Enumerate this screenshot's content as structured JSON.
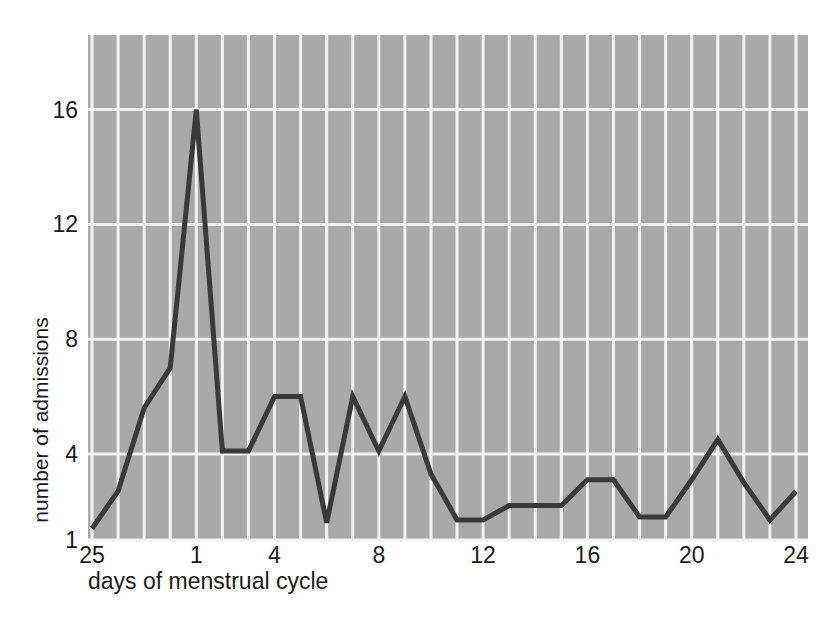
{
  "chart_data": {
    "type": "line",
    "title": "",
    "xlabel": "days of menstrual cycle",
    "ylabel": "number of admissions",
    "x": [
      25,
      26,
      27,
      28,
      1,
      2,
      3,
      4,
      5,
      6,
      7,
      8,
      9,
      10,
      11,
      12,
      13,
      14,
      15,
      16,
      17,
      18,
      19,
      20,
      21,
      22,
      23,
      24
    ],
    "values": [
      1.4,
      2.7,
      5.6,
      7.0,
      16.0,
      4.1,
      4.1,
      6.0,
      6.0,
      1.6,
      6.0,
      4.1,
      6.0,
      3.3,
      1.7,
      1.7,
      2.2,
      2.2,
      2.2,
      3.1,
      3.1,
      1.8,
      1.8,
      3.1,
      4.5,
      3.0,
      1.7,
      2.7
    ],
    "xtick_values": [
      25,
      1,
      4,
      8,
      12,
      16,
      20,
      24
    ],
    "xtick_labels": [
      "25",
      "1",
      "4",
      "8",
      "12",
      "16",
      "20",
      "24"
    ],
    "ytick_values": [
      1,
      4,
      8,
      12,
      16
    ],
    "ytick_labels": [
      "1",
      "4",
      "8",
      "12",
      "16"
    ],
    "xlim": [
      25,
      24
    ],
    "ylim": [
      1,
      18.6
    ],
    "grid": true,
    "grid_x": true,
    "grid_y": true,
    "legend": null,
    "colors": {
      "plot_background": "#a9a9a9",
      "grid_line": "#f2f2f2",
      "data_line": "#3a3a3a",
      "page_background": "#ffffff",
      "text": "#1a1a1a"
    },
    "line_width": 5
  }
}
